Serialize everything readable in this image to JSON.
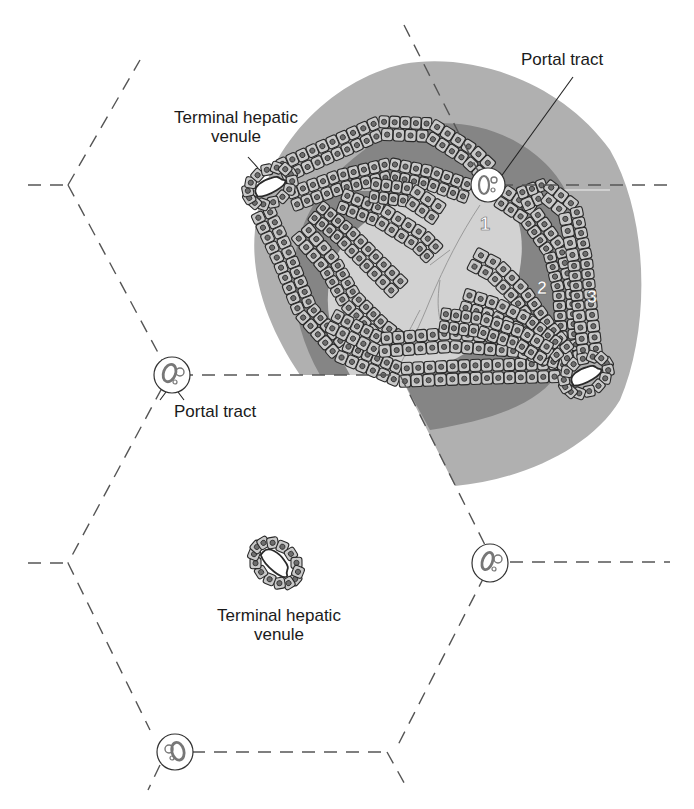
{
  "figure": {
    "labels": {
      "portal_tract_top": "Portal tract",
      "portal_tract_left": "Portal tract",
      "thv_top_line1": "Terminal hepatic",
      "thv_top_line2": "venule",
      "thv_center_line1": "Terminal hepatic",
      "thv_center_line2": "venule"
    },
    "zones": [
      {
        "number": "1",
        "name": "zone-1",
        "color": "#d2d2d2"
      },
      {
        "number": "2",
        "name": "zone-2",
        "color": "#8c8c8c"
      },
      {
        "number": "3",
        "name": "zone-3",
        "color": "#b0b0b0"
      }
    ],
    "colors": {
      "line": "#555555",
      "cell_fill": "#c9c9c9",
      "nucleus": "#6e6e6e",
      "outline": "#2a2a2a",
      "background": "#ffffff"
    }
  }
}
